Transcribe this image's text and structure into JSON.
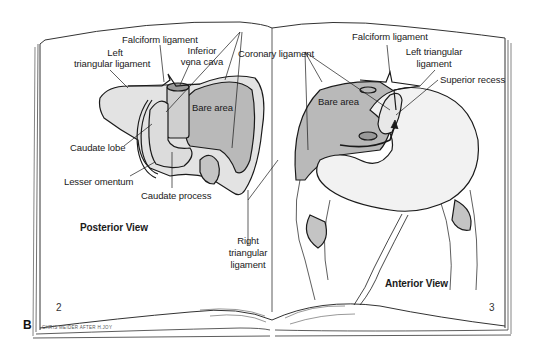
{
  "figure": {
    "panel_letter": "B",
    "signature": "CHRIS MEIDER AFTER H.JOY",
    "colors": {
      "line": "#1a1a1a",
      "bare_area_fill": "#b9b9b9",
      "liver_fill": "#e3e3e3",
      "stomach_fill": "#f2f2f2",
      "page": "#ffffff"
    }
  },
  "left_page": {
    "page_number": "2",
    "view_title": "Posterior View",
    "labels": {
      "falciform": "Falciform ligament",
      "left_triangular_1": "Left",
      "left_triangular_2": "triangular ligament",
      "ivc_1": "Inferior",
      "ivc_2": "vena cava",
      "bare_area": "Bare area",
      "caudate_lobe": "Caudate lobe",
      "lesser_omentum": "Lesser omentum",
      "caudate_process": "Caudate process"
    }
  },
  "shared": {
    "coronary_ligament": "Coronary ligament",
    "right_triangular_1": "Right",
    "right_triangular_2": "triangular",
    "right_triangular_3": "ligament"
  },
  "right_page": {
    "page_number": "3",
    "view_title": "Anterior View",
    "labels": {
      "falciform": "Falciform ligament",
      "left_triangular_1": "Left triangular",
      "left_triangular_2": "ligament",
      "superior_recess": "Superior recess",
      "bare_area": "Bare area"
    }
  }
}
